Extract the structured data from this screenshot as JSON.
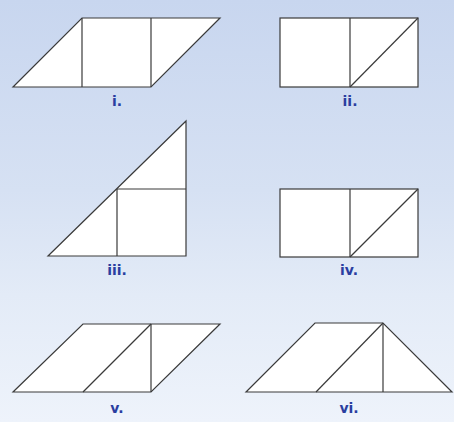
{
  "figures": [
    {
      "label": "i.",
      "shape": "parallelogram",
      "pieces": [
        "triangle",
        "square",
        "triangle"
      ]
    },
    {
      "label": "ii.",
      "shape": "rectangle",
      "pieces": [
        "square",
        "triangle",
        "triangle"
      ]
    },
    {
      "label": "iii.",
      "shape": "right-triangle",
      "pieces": [
        "triangle",
        "square",
        "triangle"
      ]
    },
    {
      "label": "iv.",
      "shape": "rectangle",
      "pieces": [
        "square",
        "triangle",
        "triangle"
      ]
    },
    {
      "label": "v.",
      "shape": "parallelogram",
      "pieces": [
        "parallelogram",
        "triangle",
        "triangle"
      ]
    },
    {
      "label": "vi.",
      "shape": "trapezoid",
      "pieces": [
        "parallelogram",
        "triangle",
        "triangle"
      ]
    }
  ],
  "colors": {
    "label": "#2a3ea0",
    "stroke": "#333333",
    "fill": "#ffffff"
  }
}
